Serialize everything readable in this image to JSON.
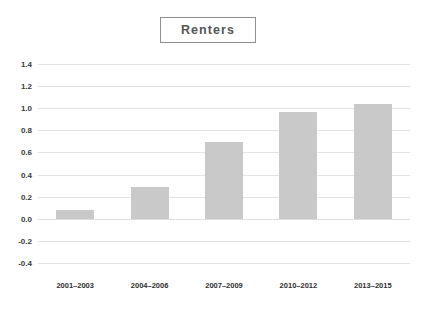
{
  "chart_data": {
    "type": "bar",
    "title": "Renters",
    "xlabel": "",
    "ylabel": "",
    "categories": [
      "2001–2003",
      "2004–2006",
      "2007–2009",
      "2010–2012",
      "2013–2015"
    ],
    "values": [
      0.08,
      0.29,
      0.69,
      0.97,
      1.04
    ],
    "ylim": [
      -0.4,
      1.4
    ],
    "ytick_labels": [
      "1.4",
      "1.2",
      "1.0",
      "0.8",
      "0.6",
      "0.4",
      "0.2",
      "0.0",
      "-0.2",
      "-0.4"
    ],
    "ytick_values": [
      1.4,
      1.2,
      1.0,
      0.8,
      0.6,
      0.4,
      0.2,
      0.0,
      -0.2,
      -0.4
    ],
    "grid": true,
    "legend": false,
    "legend_position": "none",
    "bar_color": "#c9c9c9",
    "gridline_color": "#e3e3e3",
    "title_border_color": "#8f8f8f",
    "title_text_color": "#555555",
    "axis_text_color": "#2f2f2f",
    "background_color": "#ffffff"
  }
}
